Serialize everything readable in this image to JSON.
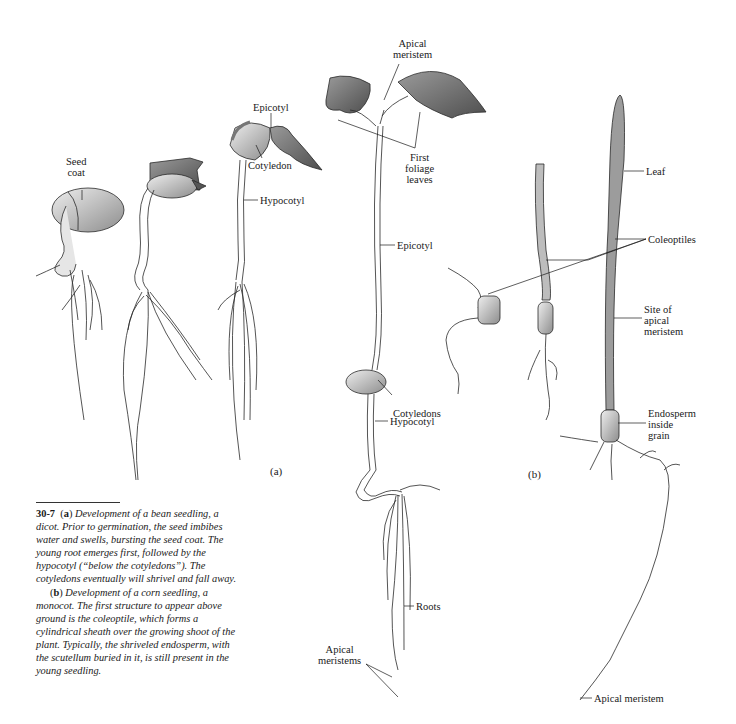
{
  "figure": {
    "panel_a_label": "(a)",
    "panel_b_label": "(b)"
  },
  "labels": {
    "seed_coat": [
      "Seed",
      "coat"
    ],
    "epicotyl_top": "Epicotyl",
    "cotyledon": "Cotyledon",
    "hypocotyl_top": "Hypocotyl",
    "apical_meristem_top": [
      "Apical",
      "meristem"
    ],
    "first_foliage_leaves": [
      "First",
      "foliage",
      "leaves"
    ],
    "epicotyl_mid": "Epicotyl",
    "cotyledons": "Cotyledons",
    "hypocotyl_lower": "Hypocotyl",
    "roots": "Roots",
    "apical_meristems": [
      "Apical",
      "meristems"
    ],
    "leaf": "Leaf",
    "coleoptiles": "Coleoptiles",
    "site_apical_meristem": [
      "Site of",
      "apical",
      "meristem"
    ],
    "endosperm": [
      "Endosperm",
      "inside",
      "grain"
    ],
    "apical_meristem_bottom": "Apical meristem"
  },
  "caption": {
    "number": "30-7",
    "a_tag": "a",
    "a_text": "Development of a bean seedling, a dicot. Prior to germination, the seed imbibes water and swells, bursting the seed coat. The young root emerges first, followed by the hypocotyl (“below the cotyledons”). The cotyledons eventually will shrivel and fall away.",
    "b_tag": "b",
    "b_text": "Development of a corn seedling, a monocot. The first structure to appear above ground is the coleoptile, which forms a cylindrical sheath over the growing shoot of the plant. Typically, the shriveled endosperm, with the scutellum buried in it, is still present in the young seedling."
  }
}
